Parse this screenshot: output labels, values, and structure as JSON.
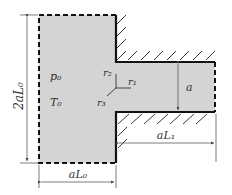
{
  "diagram": {
    "type": "nozzle-chamber-schematic",
    "chamber": {
      "pressure_label": "p₀",
      "temperature_label": "T₀"
    },
    "axes": {
      "r1": "r₁",
      "r2": "r₂",
      "r3": "r₃"
    },
    "dimensions": {
      "chamber_height": "2aL₀",
      "chamber_width": "aL₀",
      "channel_length": "aL₁",
      "channel_width": "a"
    },
    "colors": {
      "fluid": "#d4d4d4",
      "wall": "#111111",
      "dimension": "#444444"
    }
  }
}
